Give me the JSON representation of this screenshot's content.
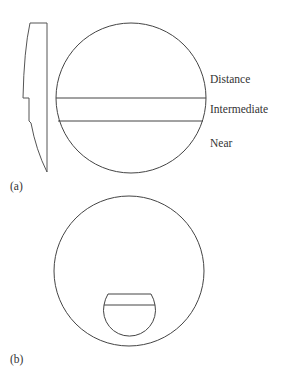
{
  "figure": {
    "panel_a": {
      "label": "(a)",
      "zones": [
        {
          "name": "distance",
          "label": "Distance"
        },
        {
          "name": "intermediate",
          "label": "Intermediate"
        },
        {
          "name": "near",
          "label": "Near"
        }
      ],
      "description": "Trifocal lens with side profile"
    },
    "panel_b": {
      "label": "(b)",
      "description": "Lens with segmented near addition"
    },
    "colors": {
      "stroke": "#444444",
      "text": "#333333",
      "background": "#ffffff"
    }
  }
}
